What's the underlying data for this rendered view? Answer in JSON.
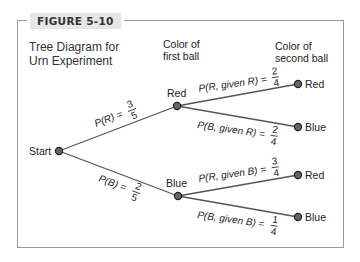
{
  "figure": {
    "label": "FIGURE 5-10",
    "title_line1": "Tree Diagram for",
    "title_line2": "Urn Experiment"
  },
  "columns": {
    "first": {
      "line1": "Color of",
      "line2": "first ball"
    },
    "second": {
      "line1": "Color of",
      "line2": "second ball"
    }
  },
  "nodes": {
    "start": "Start",
    "first_red": "Red",
    "first_blue": "Blue",
    "leaf_rr": "Red",
    "leaf_rb": "Blue",
    "leaf_br": "Red",
    "leaf_bb": "Blue"
  },
  "branches": {
    "p_r": {
      "lhs": "P(R) =",
      "num": "3",
      "den": "5"
    },
    "p_b": {
      "lhs": "P(B) =",
      "num": "2",
      "den": "5"
    },
    "p_r_given_r": {
      "lhs": "P(R, given R) =",
      "num": "2",
      "den": "4"
    },
    "p_b_given_r": {
      "lhs": "P(B, given R) =",
      "num": "2",
      "den": "4"
    },
    "p_r_given_b": {
      "lhs": "P(R, given B) =",
      "num": "3",
      "den": "4"
    },
    "p_b_given_b": {
      "lhs": "P(B, given B) =",
      "num": "1",
      "den": "4"
    }
  },
  "colors": {
    "line": "#555555",
    "node_fill": "#666666",
    "node_stroke": "#222222",
    "frame": "#9a9a9a",
    "label_bg": "#e6e6e6"
  }
}
